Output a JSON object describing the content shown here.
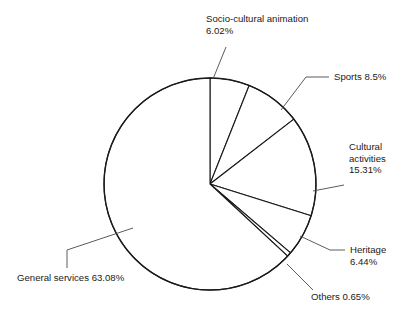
{
  "chart_data": {
    "type": "pie",
    "title": "",
    "subtitle": "",
    "xlabel": "",
    "ylabel": "",
    "legend_position": "none",
    "grid": false,
    "start_angle_deg": 0,
    "direction": "clockwise",
    "units": "percent",
    "categories": [
      "Socio-cultural animation",
      "Sports",
      "Cultural activities",
      "Heritage",
      "Others",
      "General services"
    ],
    "values": [
      6.02,
      8.5,
      15.31,
      6.44,
      0.65,
      63.08
    ],
    "slices": [
      {
        "name": "Socio-cultural animation",
        "value": 6.02,
        "value_label": "6.02%",
        "label_lines": [
          "Socio-cultural animation",
          "6.02%"
        ]
      },
      {
        "name": "Sports",
        "value": 8.5,
        "value_label": "8.5%",
        "label_lines": [
          "Sports 8.5%"
        ]
      },
      {
        "name": "Cultural activities",
        "value": 15.31,
        "value_label": "15.31%",
        "label_lines": [
          "Cultural",
          "activities",
          "15.31%"
        ]
      },
      {
        "name": "Heritage",
        "value": 6.44,
        "value_label": "6.44%",
        "label_lines": [
          "Heritage",
          "6.44%"
        ]
      },
      {
        "name": "Others",
        "value": 0.65,
        "value_label": "0.65%",
        "label_lines": [
          "Others 0.65%"
        ]
      },
      {
        "name": "General services",
        "value": 63.08,
        "value_label": "63.08%",
        "label_lines": [
          "General services 63.08%"
        ]
      }
    ],
    "colors": {
      "slice_fill": "#ffffff",
      "slice_stroke": "#1a1a1a",
      "leader_line": "#4a4a4a",
      "text": "#1a1a1a",
      "background": "#ffffff"
    },
    "geometry": {
      "center_x": 210,
      "center_y": 184,
      "radius": 106
    }
  },
  "labels": {
    "socio_cultural_l1": "Socio-cultural animation",
    "socio_cultural_l2": "6.02%",
    "sports_l1": "Sports 8.5%",
    "cultural_l1": "Cultural",
    "cultural_l2": "activities",
    "cultural_l3": "15.31%",
    "heritage_l1": "Heritage",
    "heritage_l2": "6.44%",
    "others_l1": "Others 0.65%",
    "general_l1": "General services 63.08%"
  }
}
